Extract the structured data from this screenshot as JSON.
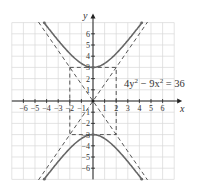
{
  "chart_data": {
    "type": "line",
    "title": "",
    "equation": "4y^2 - 9x^2 = 36",
    "equation_parts": {
      "a": "4y",
      "b": " − 9x",
      "c": " = 36",
      "exp": "2"
    },
    "xlabel": "x",
    "ylabel": "y",
    "xlim": [
      -7,
      7
    ],
    "ylim": [
      -7,
      7
    ],
    "grid": true,
    "x_ticks": [
      -6,
      -5,
      -4,
      -3,
      -2,
      -1,
      1,
      2,
      3,
      4,
      5,
      6
    ],
    "y_ticks": [
      -6,
      -5,
      -4,
      -3,
      -2,
      -1,
      1,
      2,
      3,
      4,
      5,
      6
    ],
    "x_tick_labels": [
      "−6",
      "−5",
      "−4",
      "−3",
      "−2",
      "−1",
      "1",
      "2",
      "3",
      "4",
      "5",
      "6"
    ],
    "y_tick_labels": [
      "6",
      "5",
      "4",
      "3",
      "2",
      "1",
      "−1",
      "−2",
      "−3",
      "−4",
      "−5",
      "−6"
    ],
    "series": [
      {
        "name": "hyperbola upper branch",
        "style": "solid",
        "formula": "y = sqrt(9 + 9x^2/4)",
        "x_range": [
          -4.2,
          4.2
        ]
      },
      {
        "name": "hyperbola lower branch",
        "style": "solid",
        "formula": "y = -sqrt(9 + 9x^2/4)",
        "x_range": [
          -4.2,
          4.2
        ]
      },
      {
        "name": "asymptote",
        "style": "dashed",
        "formula": "y = 1.5x"
      },
      {
        "name": "asymptote",
        "style": "dashed",
        "formula": "y = -1.5x"
      },
      {
        "name": "fundamental rectangle",
        "style": "dashed",
        "corners": [
          [
            -2,
            3
          ],
          [
            2,
            3
          ],
          [
            2,
            -3
          ],
          [
            -2,
            -3
          ]
        ]
      }
    ],
    "vertices": [
      [
        0,
        3
      ],
      [
        0,
        -3
      ]
    ],
    "colors": {
      "curve": "#666666",
      "dashed": "#444444",
      "grid": "#d9d9d9",
      "axis": "#222222"
    }
  }
}
